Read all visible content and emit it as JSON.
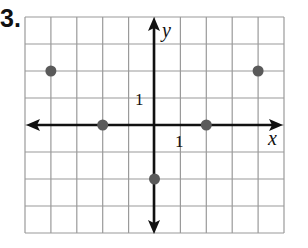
{
  "problem": {
    "number": "3."
  },
  "chart_data": {
    "type": "scatter",
    "title": "",
    "xlabel": "x",
    "ylabel": "y",
    "xlim": [
      -5,
      5
    ],
    "ylim": [
      -4,
      4
    ],
    "grid": true,
    "tick_labels": {
      "x": "1",
      "y": "1"
    },
    "points": [
      {
        "x": -4,
        "y": 2
      },
      {
        "x": -2,
        "y": 0
      },
      {
        "x": 2,
        "y": 0
      },
      {
        "x": 4,
        "y": 2
      },
      {
        "x": 0,
        "y": -2
      }
    ],
    "colors": {
      "point": "#5a5a5a",
      "grid": "#9a9a9a",
      "axis": "#111111"
    }
  }
}
